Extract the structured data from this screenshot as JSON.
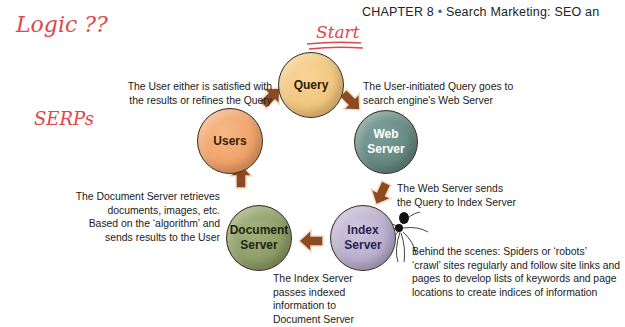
{
  "annotations": {
    "logic": "Logic ??",
    "start": "Start",
    "serps": "SERPs"
  },
  "header": {
    "chapter": "CHAPTER 8",
    "separator": "•",
    "title": "Search Marketing: SEO an"
  },
  "nodes": [
    {
      "id": "query",
      "label": "Query",
      "color": "#f0c27a"
    },
    {
      "id": "web-server",
      "label_line1": "Web",
      "label_line2": "Server",
      "color": "#5f8682"
    },
    {
      "id": "index-server",
      "label_line1": "Index",
      "label_line2": "Server",
      "color": "#b3a9c9"
    },
    {
      "id": "document-server",
      "label_line1": "Document",
      "label_line2": "Server",
      "color": "#8a9a64"
    },
    {
      "id": "users",
      "label": "Users",
      "color": "#ef9e64"
    }
  ],
  "captions": {
    "users_to_query": [
      "The User either is satisfied with",
      "the results or refines the Query"
    ],
    "query_to_web": [
      "The User-initiated Query goes to",
      "search engine's Web Server"
    ],
    "web_to_index": [
      "The Web Server sends",
      "the Query to Index Server"
    ],
    "document_to_users": [
      "The Document Server retrieves",
      "documents, images, etc.",
      "Based on the ‘algorithm’ and",
      "sends results to the User"
    ],
    "index_to_document": [
      "The Index Server",
      "passes indexed",
      "information to",
      "Document Server"
    ],
    "spiders": [
      "Behind the scenes: Spiders or ‘robots’",
      "‘crawl’ sites regularly and follow site links and",
      "pages to develop lists of keywords and page",
      "locations to create indices of information"
    ]
  },
  "colors": {
    "arrow": "#8b4a22",
    "annotation": "#e0474c"
  }
}
